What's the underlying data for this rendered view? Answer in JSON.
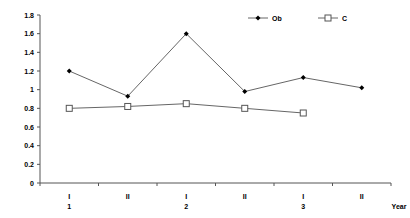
{
  "chart_data": {
    "type": "line",
    "title": "",
    "xlabel": "Year",
    "ylabel": "",
    "ylim": [
      0,
      1.8
    ],
    "yticks": [
      "0",
      "0.2",
      "0.4",
      "0.6",
      "0.8",
      "1",
      "1.2",
      "1.4",
      "1.6",
      "1.8"
    ],
    "categories": [
      "I",
      "II",
      "I",
      "II",
      "I",
      "II"
    ],
    "year_labels": [
      {
        "label": "1",
        "category_index": 0
      },
      {
        "label": "2",
        "category_index": 2
      },
      {
        "label": "3",
        "category_index": 4
      }
    ],
    "grid": false,
    "legend_position": "top-right",
    "series": [
      {
        "name": "Ob",
        "marker": "filled-diamond",
        "values": [
          1.2,
          0.93,
          1.6,
          0.98,
          1.13,
          1.02
        ]
      },
      {
        "name": "C",
        "marker": "open-square",
        "values": [
          0.8,
          0.82,
          0.85,
          0.8,
          0.75,
          null
        ]
      }
    ]
  }
}
